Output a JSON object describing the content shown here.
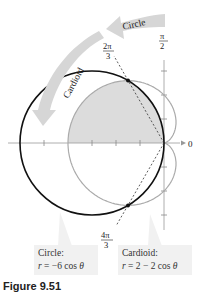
{
  "figure": {
    "axis_labels": {
      "polar_axis": "0",
      "vertical_axis_num": "π",
      "vertical_axis_den": "2"
    },
    "angle_labels": [
      {
        "num": "2π",
        "den": "3"
      },
      {
        "num": "4π",
        "den": "3"
      }
    ],
    "arrow_labels": {
      "circle": "Circle",
      "cardioid": "Cardioid"
    },
    "boxes": {
      "circle": {
        "title": "Circle:",
        "eq_lhs": "r",
        "eq_rhs": " = −6 cos ",
        "eq_var": "θ"
      },
      "cardioid": {
        "title": "Cardioid:",
        "eq_lhs": "r",
        "eq_rhs": " = 2 − 2 cos ",
        "eq_var": "θ"
      }
    },
    "caption": "Figure 9.51",
    "colors": {
      "circle_stroke": "#111111",
      "cardioid_stroke": "#aaaaaa",
      "shade_fill": "#dcdcdc",
      "arrow_fill": "#d6d6d6",
      "box_fill": "#f1f1f1"
    }
  }
}
